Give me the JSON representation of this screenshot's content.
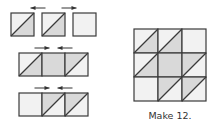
{
  "caption": "Make 12.",
  "colors": {
    "light": "#f2f2f2",
    "dark": "#d9d9d9",
    "line": "#3a3a3a",
    "arrow": "#333333"
  },
  "cell_legend": {
    "L": "plain light square",
    "D": "plain dark square",
    "HL": "half-square triangle: light upper-left, dark lower-right",
    "HD": "half-square triangle: dark upper-left, light lower-right"
  },
  "rows": [
    {
      "cells": [
        "HL",
        "HL",
        "L"
      ],
      "arrows": [
        "left",
        "right"
      ],
      "joined": false
    },
    {
      "cells": [
        "HL",
        "D",
        "HD"
      ],
      "arrows": [
        "right",
        "left"
      ],
      "joined": true
    },
    {
      "cells": [
        "L",
        "HD",
        "HD"
      ],
      "arrows": [
        "right",
        "left"
      ],
      "joined": true
    }
  ],
  "block": [
    [
      "HL",
      "HL",
      "L"
    ],
    [
      "HL",
      "D",
      "HD"
    ],
    [
      "L",
      "HD",
      "HD"
    ]
  ]
}
